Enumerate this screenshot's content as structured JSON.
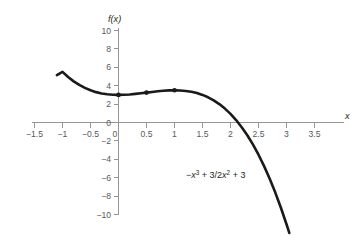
{
  "chart_data": {
    "type": "line",
    "title": "",
    "subtitle": "",
    "xlabel": "x",
    "ylabel": "f(x)",
    "xlim": [
      -1.5,
      3.5
    ],
    "ylim": [
      -10,
      10
    ],
    "grid": false,
    "legend": "none",
    "equation_label": "−x³ + 3/2x² + 3",
    "equation_parts": {
      "minus": "−",
      "x1": "x",
      "exp1": "3",
      "plus": " + ",
      "coef": "3/2",
      "x2": "x",
      "exp2": "2",
      "tail": " + 3"
    },
    "xticks": [
      -1.5,
      -1,
      -0.5,
      0,
      0.5,
      1,
      1.5,
      2,
      2.5,
      3,
      3.5
    ],
    "xtick_labels": [
      "−1.5",
      "−1",
      "−0.5",
      "0",
      "0.5",
      "1",
      "1.5",
      "2",
      "2.5",
      "3",
      "3.5"
    ],
    "yticks": [
      -10,
      -8,
      -6,
      -4,
      -2,
      0,
      2,
      4,
      6,
      8,
      10
    ],
    "ytick_labels": [
      "−10",
      "−8",
      "−6",
      "−4",
      "−2",
      "0",
      "2",
      "4",
      "6",
      "8",
      "10"
    ],
    "series": [
      {
        "name": "-x^3 + 3/2x^2 + 3",
        "x": [
          -1.1,
          -1.0,
          -0.9,
          -0.8,
          -0.7,
          -0.6,
          -0.5,
          -0.4,
          -0.3,
          -0.2,
          -0.1,
          0.0,
          0.1,
          0.2,
          0.3,
          0.4,
          0.5,
          0.6,
          0.7,
          0.8,
          0.9,
          1.0,
          1.1,
          1.2,
          1.3,
          1.4,
          1.5,
          1.6,
          1.7,
          1.8,
          1.9,
          2.0,
          2.1,
          2.2,
          2.3,
          2.4,
          2.5,
          2.6,
          2.7,
          2.8,
          2.9,
          3.0,
          3.05
        ],
        "y": [
          5.15,
          5.5,
          4.94,
          4.47,
          4.08,
          3.76,
          3.5,
          3.3,
          3.16,
          3.07,
          3.02,
          3.0,
          3.01,
          3.05,
          3.11,
          3.18,
          3.25,
          3.32,
          3.39,
          3.45,
          3.49,
          3.5,
          3.48,
          3.43,
          3.34,
          3.2,
          3.0,
          2.74,
          2.41,
          2.0,
          1.51,
          0.94,
          0.27,
          -0.51,
          -1.39,
          -2.38,
          -3.5,
          -4.74,
          -6.11,
          -7.62,
          -9.27,
          -11.06,
          -12.0
        ]
      }
    ],
    "points": [
      {
        "label": "point-at-x0",
        "x": 0.0,
        "y": 3.0
      },
      {
        "label": "point-at-x0.5",
        "x": 0.5,
        "y": 3.25
      },
      {
        "label": "point-at-x1",
        "x": 1.0,
        "y": 3.5
      }
    ]
  }
}
